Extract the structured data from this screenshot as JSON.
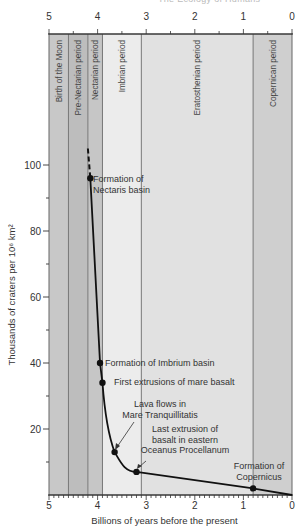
{
  "page_header": {
    "running_head": "The Ecology of Humans",
    "page_mark": "1"
  },
  "chart_data": {
    "type": "line",
    "title": "",
    "xlabel": "Billions of years before the present",
    "ylabel": "Thousands of craters per 10⁶ km²",
    "xlim": [
      5,
      0
    ],
    "ylim": [
      0,
      110
    ],
    "x_ticks": [
      5,
      4,
      3,
      2,
      1,
      0
    ],
    "y_ticks": [
      20,
      40,
      60,
      80,
      100
    ],
    "grid": false,
    "legend": null,
    "periods": [
      {
        "name": "Birth of the Moon",
        "start": 5.0,
        "end": 4.6,
        "color": "#c8c8c8"
      },
      {
        "name": "Pre-Nectarian period",
        "start": 4.6,
        "end": 4.2,
        "color": "#bdbdbd"
      },
      {
        "name": "Nectarian period",
        "start": 4.2,
        "end": 3.9,
        "color": "#c6c6c6"
      },
      {
        "name": "Imbrian period",
        "start": 3.9,
        "end": 3.1,
        "color": "#ececec"
      },
      {
        "name": "Eratosthenian period",
        "start": 3.1,
        "end": 0.8,
        "color": "#e1e1e1"
      },
      {
        "name": "Copernican period",
        "start": 0.8,
        "end": 0.0,
        "color": "#cfcfcf"
      }
    ],
    "series": [
      {
        "name": "Cumulative crater density",
        "x": [
          4.15,
          3.95,
          3.9,
          3.65,
          3.2,
          0.8,
          0.0
        ],
        "y": [
          96,
          40,
          34,
          13,
          7,
          2,
          0
        ]
      }
    ],
    "dashed_extension": {
      "x": [
        4.2,
        4.15
      ],
      "y": [
        105,
        96
      ]
    },
    "annotations": [
      {
        "label": "Formation of\nNectaris basin",
        "x": 4.15,
        "y": 96
      },
      {
        "label": "Formation of Imbrium basin",
        "x": 3.95,
        "y": 40
      },
      {
        "label": "First extrusions of mare basalt",
        "x": 3.9,
        "y": 34
      },
      {
        "label": "Lava flows in\nMare Tranquillitatis",
        "x": 3.65,
        "y": 13
      },
      {
        "label": "Last extrusion of\nbasalt in eastern\nOceanus Procellanum",
        "x": 3.2,
        "y": 7
      },
      {
        "label": "Formation of\nCopernicus",
        "x": 0.8,
        "y": 2
      }
    ]
  }
}
